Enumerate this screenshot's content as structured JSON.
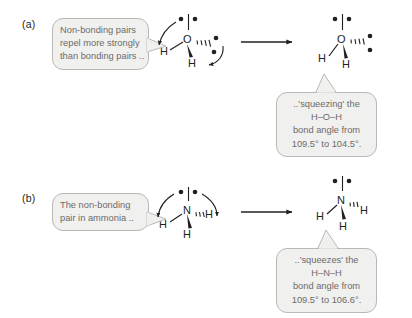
{
  "figure": {
    "panels": [
      {
        "id": "a",
        "label": "(a)",
        "callout": {
          "lines": [
            "Non-bonding pairs",
            "repel more strongly",
            "than bonding pairs .."
          ]
        },
        "result_callout": {
          "lines": [
            "..'squeezing' the",
            "H–O–H",
            "bond angle from",
            "109.5° to 104.5°."
          ]
        },
        "left_molecule": {
          "center": "O",
          "hydrogens": [
            "H",
            "H"
          ],
          "lone_pairs": 2,
          "angle_label": "109.5°"
        },
        "right_molecule": {
          "center": "O",
          "hydrogens": [
            "H",
            "H"
          ],
          "lone_pairs": 2,
          "angle_label": "104.5°"
        }
      },
      {
        "id": "b",
        "label": "(b)",
        "callout": {
          "lines": [
            "The non-bonding",
            "pair in ammonia .."
          ]
        },
        "result_callout": {
          "lines": [
            "..'squeezes' the",
            "H–N–H",
            "bond angle from",
            "109.5° to 106.6°."
          ]
        },
        "left_molecule": {
          "center": "N",
          "hydrogens": [
            "H",
            "H",
            "H"
          ],
          "lone_pairs": 1,
          "angle_label": "109.5°"
        },
        "right_molecule": {
          "center": "N",
          "hydrogens": [
            "H",
            "H",
            "H"
          ],
          "lone_pairs": 1,
          "angle_label": "106.6°"
        }
      }
    ],
    "colors": {
      "bubble_fill": "#f0f0ef",
      "bubble_border": "#b9b8b6",
      "bubble_text": "#6d6b69",
      "ink": "#231f20",
      "background": "#ffffff"
    }
  }
}
